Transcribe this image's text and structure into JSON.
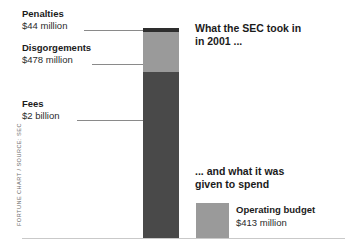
{
  "credit": "FORTUNE CHART / SOURCE: SEC",
  "callouts": {
    "intake_line1": "What the SEC took in",
    "intake_line2": "in 2001 ...",
    "spend_line1": "... and what it was",
    "spend_line2": "given to spend"
  },
  "labels": {
    "penalties_title": "Penalties",
    "penalties_value": "$44 million",
    "disgorgements_title": "Disgorgements",
    "disgorgements_value": "$478 million",
    "fees_title": "Fees",
    "fees_value": "$2 billion",
    "budget_title": "Operating budget",
    "budget_value": "$413 million"
  },
  "chart_data": {
    "type": "bar",
    "xlabel": "",
    "ylabel": "",
    "ylim": [
      0,
      2522
    ],
    "grid": false,
    "legend": "none",
    "categories": [
      "SEC revenue 2001",
      "Operating budget"
    ],
    "stacked_series": [
      {
        "name": "Fees",
        "value": 2000,
        "unit": "$ million",
        "display": "$2 billion",
        "color": "#494949"
      },
      {
        "name": "Disgorgements",
        "value": 478,
        "unit": "$ million",
        "display": "$478 million",
        "color": "#9a9a9a"
      },
      {
        "name": "Penalties",
        "value": 44,
        "unit": "$ million",
        "display": "$44 million",
        "color": "#2e2e2e"
      }
    ],
    "bars": [
      {
        "name": "SEC revenue 2001",
        "total": 2522,
        "unit": "$ million"
      },
      {
        "name": "Operating budget",
        "total": 413,
        "unit": "$ million",
        "display": "$413 million",
        "color": "#9a9a9a"
      }
    ],
    "colors": {
      "penalties": "#2e2e2e",
      "disgorgements": "#9a9a9a",
      "fees": "#494949",
      "budget": "#9a9a9a",
      "baseline": "#c9c9c9"
    }
  }
}
